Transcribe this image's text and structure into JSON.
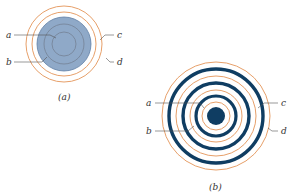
{
  "figure_a": {
    "caption": "(a)",
    "labels": {
      "a": "a",
      "b": "b",
      "c": "c",
      "d": "d"
    },
    "colors": {
      "disk": "#8fa9c8",
      "disk_edge": "#5f7fa6",
      "inner_ring": "#7a8aa0",
      "orange": "#e7a06a"
    }
  },
  "figure_b": {
    "caption": "(b)",
    "labels": {
      "a": "a",
      "b": "b",
      "c": "c",
      "d": "d"
    },
    "colors": {
      "dark": "#0f3d62",
      "orange": "#e7a06a"
    }
  }
}
